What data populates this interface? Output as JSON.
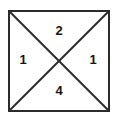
{
  "figure": {
    "type": "geometry-diagram",
    "shape": "square-with-both-diagonals",
    "background_color": "#ffffff",
    "stroke_color": "#2b2b2b",
    "label_color": "#161616",
    "square": {
      "left": 8,
      "top": 10,
      "right": 110,
      "bottom": 112,
      "border_width": 2
    },
    "diagonals": {
      "stroke_width": 2,
      "center_x": 59,
      "center_y": 61
    },
    "regions": [
      {
        "position": "top",
        "label": "2",
        "x": 59,
        "y": 31
      },
      {
        "position": "left",
        "label": "1",
        "x": 23,
        "y": 60
      },
      {
        "position": "right",
        "label": "1",
        "x": 93,
        "y": 60
      },
      {
        "position": "bottom",
        "label": "4",
        "x": 59,
        "y": 91
      }
    ]
  }
}
